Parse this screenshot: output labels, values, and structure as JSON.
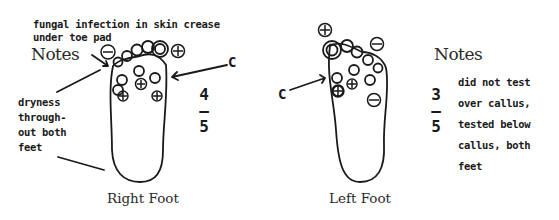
{
  "feet": [
    {
      "label": "Right Foot",
      "notes_label": "Notes",
      "score": {
        "numerator": "4",
        "separator": "–",
        "denominator": "5"
      },
      "annotations": {
        "top": [
          "fungal infection in skin crease",
          "under toe pad"
        ],
        "left": [
          "dryness",
          "through-",
          "out both",
          "feet"
        ],
        "callus_marker": "C"
      },
      "test_sites": [
        {
          "site": "big toe",
          "result": "+"
        },
        {
          "site": "4th toe (outside)",
          "result": "-"
        },
        {
          "site": "forefoot medial",
          "result": "+"
        },
        {
          "site": "forefoot center",
          "result": "+"
        },
        {
          "site": "forefoot lateral",
          "result": "+"
        }
      ]
    },
    {
      "label": "Left Foot",
      "notes_label": "Notes",
      "score": {
        "numerator": "3",
        "separator": "–",
        "denominator": "5"
      },
      "annotations": {
        "right": [
          "did not test",
          "over callus,",
          "tested below",
          "callus, both",
          "feet"
        ],
        "callus_marker": "C"
      },
      "test_sites": [
        {
          "site": "big toe",
          "result": "+"
        },
        {
          "site": "little toe",
          "result": "-"
        },
        {
          "site": "forefoot medial",
          "result": "+"
        },
        {
          "site": "forefoot center",
          "result": "+"
        },
        {
          "site": "midfoot lateral",
          "result": "-"
        }
      ]
    }
  ]
}
